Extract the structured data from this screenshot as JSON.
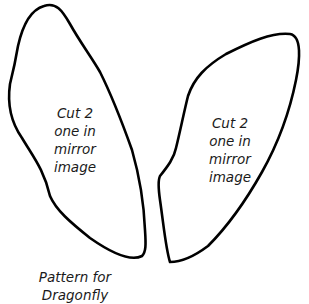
{
  "diagram": {
    "title": "Pattern for Dragonfly",
    "stroke_color": "#000000",
    "background_color": "#ffffff",
    "shapes": [
      {
        "id": "left-wing",
        "label_lines": [
          "Cut 2",
          "one in",
          "mirror",
          "image"
        ]
      },
      {
        "id": "right-wing",
        "label_lines": [
          "Cut 2",
          "one in",
          "mirror",
          "image"
        ]
      }
    ],
    "caption_lines": [
      "Pattern for",
      "Dragonfly"
    ]
  }
}
